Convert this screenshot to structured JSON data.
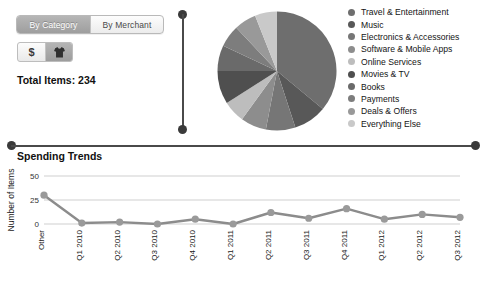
{
  "segmented_control": {
    "options": [
      {
        "label": "By Category",
        "active": true
      },
      {
        "label": "By Merchant",
        "active": false
      }
    ]
  },
  "icon_toggle": {
    "buttons": [
      {
        "name": "dollar-icon",
        "glyph": "$",
        "active": false
      },
      {
        "name": "tshirt-icon",
        "glyph": "tshirt",
        "active": true
      }
    ]
  },
  "summary": {
    "total_items_label": "Total Items: 234"
  },
  "legend": {
    "items": [
      {
        "label": "Travel & Entertainment",
        "color": "#6e6e6e"
      },
      {
        "label": "Music",
        "color": "#585858"
      },
      {
        "label": "Electronics & Accessories",
        "color": "#767676"
      },
      {
        "label": "Software & Mobile Apps",
        "color": "#8d8d8d"
      },
      {
        "label": "Online Services",
        "color": "#bdbdbd"
      },
      {
        "label": "Movies & TV",
        "color": "#4f4f4f"
      },
      {
        "label": "Books",
        "color": "#6a6a6a"
      },
      {
        "label": "Payments",
        "color": "#7d7d7d"
      },
      {
        "label": "Deals & Offers",
        "color": "#999999"
      },
      {
        "label": "Everything Else",
        "color": "#c9c9c9"
      }
    ]
  },
  "trends": {
    "title": "Spending Trends"
  },
  "chart_data": [
    {
      "type": "pie",
      "title": "",
      "labels": [
        "Travel & Entertainment",
        "Music",
        "Electronics & Accessories",
        "Software & Mobile Apps",
        "Online Services",
        "Movies & TV",
        "Books",
        "Payments",
        "Deals & Offers",
        "Everything Else"
      ],
      "values": [
        36,
        9,
        8,
        7,
        6,
        9,
        7,
        6,
        6,
        6
      ],
      "colors": [
        "#6e6e6e",
        "#585858",
        "#767676",
        "#8d8d8d",
        "#bdbdbd",
        "#4f4f4f",
        "#6a6a6a",
        "#7d7d7d",
        "#999999",
        "#c9c9c9"
      ],
      "start_angle": 0,
      "direction": "clockwise",
      "legend": "right"
    },
    {
      "type": "line",
      "title": "Spending Trends",
      "xlabel": "",
      "ylabel": "Number of Items",
      "categories": [
        "Other",
        "Q1 2010",
        "Q2 2010",
        "Q3 2010",
        "Q4 2010",
        "Q1 2011",
        "Q2 2011",
        "Q3 2011",
        "Q4 2011",
        "Q1 2012",
        "Q2 2012",
        "Q3 2012"
      ],
      "values": [
        30,
        1,
        2,
        0,
        5,
        0,
        12,
        6,
        16,
        5,
        10,
        7
      ],
      "yticks": [
        0,
        25,
        50
      ],
      "ylim": [
        0,
        50
      ],
      "grid": true,
      "marker": "circle",
      "line_color": "#8c8c8c",
      "marker_color": "#9a9a9a"
    }
  ]
}
